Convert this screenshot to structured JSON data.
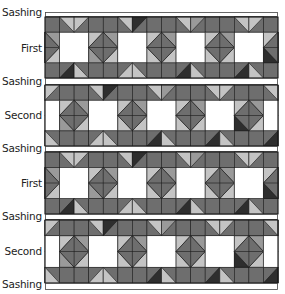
{
  "diagram": {
    "rows": [
      {
        "type": "sashing",
        "label": "Sashing"
      },
      {
        "type": "band",
        "label": "First",
        "offset": 0
      },
      {
        "type": "sashing",
        "label": "Sashing"
      },
      {
        "type": "band",
        "label": "Second",
        "offset": 2
      },
      {
        "type": "sashing",
        "label": "Sashing"
      },
      {
        "type": "band",
        "label": "First",
        "offset": 0
      },
      {
        "type": "sashing",
        "label": "Sashing"
      },
      {
        "type": "band",
        "label": "Second",
        "offset": 2
      },
      {
        "type": "sashing",
        "label": "Sashing"
      }
    ],
    "columns": 16,
    "colors": {
      "medium": "#6e6e6e",
      "dark": "#2e2e2e",
      "light": "#c4c4c4",
      "mid_light": "#9a9a9a",
      "white": "#ffffff",
      "line": "#1a1a1a"
    }
  },
  "labels": {
    "sashing_0": "Sashing",
    "band_1": "First",
    "sashing_2": "Sashing",
    "band_3": "Second",
    "sashing_4": "Sashing",
    "band_5": "First",
    "sashing_6": "Sashing",
    "band_7": "Second",
    "sashing_8": "Sashing"
  }
}
